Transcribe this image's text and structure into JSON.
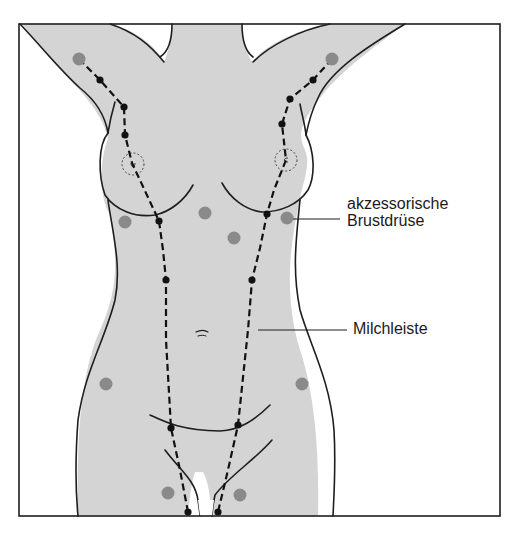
{
  "diagram": {
    "labels": {
      "accessory_gland_line1": "akzessorische",
      "accessory_gland_line2": "Brustdrüse",
      "milk_line": "Milchleiste"
    },
    "colors": {
      "skin_fill": "#d4d4d4",
      "outline": "#1e1e1e",
      "accessory_dot": "#8a8a8a",
      "milk_line_dot": "#111111",
      "background": "#ffffff"
    },
    "accessory_gland_dots": [
      {
        "x": 79,
        "y": 59
      },
      {
        "x": 332,
        "y": 59
      },
      {
        "x": 125,
        "y": 222
      },
      {
        "x": 205,
        "y": 213
      },
      {
        "x": 234,
        "y": 238
      },
      {
        "x": 287,
        "y": 218
      },
      {
        "x": 106,
        "y": 384
      },
      {
        "x": 302,
        "y": 384
      },
      {
        "x": 168,
        "y": 493
      },
      {
        "x": 240,
        "y": 495
      }
    ],
    "milk_line_points": {
      "left": [
        {
          "x": 100,
          "y": 80
        },
        {
          "x": 124,
          "y": 107
        },
        {
          "x": 125,
          "y": 135
        },
        {
          "x": 159,
          "y": 221
        },
        {
          "x": 166,
          "y": 280
        },
        {
          "x": 171,
          "y": 428
        },
        {
          "x": 188,
          "y": 512
        }
      ],
      "right": [
        {
          "x": 313,
          "y": 80
        },
        {
          "x": 290,
          "y": 99
        },
        {
          "x": 282,
          "y": 124
        },
        {
          "x": 267,
          "y": 214
        },
        {
          "x": 252,
          "y": 280
        },
        {
          "x": 238,
          "y": 425
        },
        {
          "x": 218,
          "y": 512
        }
      ]
    }
  }
}
